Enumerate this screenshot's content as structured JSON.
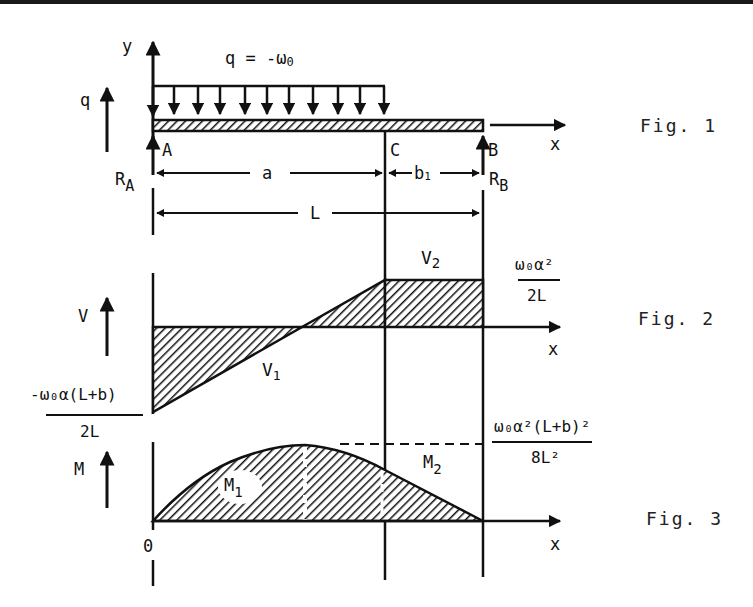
{
  "colors": {
    "ink": "#111111",
    "paper": "#ffffff"
  },
  "figure1": {
    "caption": "Fig. 1",
    "load_label": "q = -ω",
    "load_sub": "0",
    "y_axis": "y",
    "q_label": "q",
    "x_axis": "x",
    "point_a": "A",
    "point_b": "B",
    "point_c": "C",
    "reaction_a": "R",
    "reaction_a_sub": "A",
    "reaction_b": "R",
    "reaction_b_sub": "B",
    "dim_a": "a",
    "dim_b": "b",
    "dim_b_sub": "1",
    "dim_l": "L"
  },
  "figure2": {
    "caption": "Fig. 2",
    "axis_label": "V",
    "x_axis": "x",
    "v1": "V",
    "v1_sub": "1",
    "v2": "V",
    "v2_sub": "2",
    "v2_value_num": "ω₀α²",
    "v2_value_den": "2L",
    "v1_value_num": "-ω₀α(L+b)",
    "v1_value_den": "2L"
  },
  "figure3": {
    "caption": "Fig. 3",
    "axis_label": "M",
    "x_axis": "x",
    "origin": "0",
    "m1": "M",
    "m1_sub": "1",
    "m2": "M",
    "m2_sub": "2",
    "max_value_num": "ω₀α²(L+b)²",
    "max_value_den": "8L²"
  }
}
